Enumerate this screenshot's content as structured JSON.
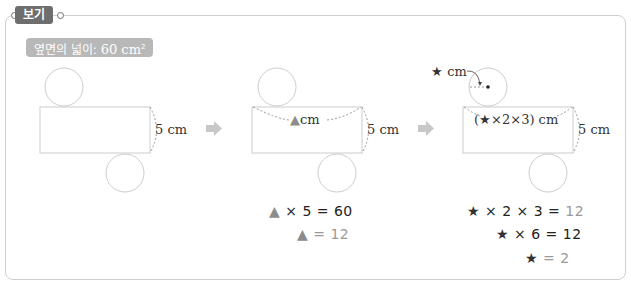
{
  "header": {
    "badge_label": "보기"
  },
  "given": {
    "label_prefix": "옆면의 넓이: ",
    "value": "60 cm",
    "superscript": "2"
  },
  "colors": {
    "badge_bg": "#6e6e6e",
    "label_bg": "#b8b8b8",
    "outline": "#cccccc",
    "arrow": "#c8c8c8",
    "triangle": "#8c8c8c"
  },
  "step1": {
    "height_label": "5 cm"
  },
  "step2": {
    "width_label_symbol": "▲",
    "width_label_unit": "cm",
    "height_label": "5 cm",
    "equations": [
      {
        "symbol": "▲",
        "expr": " × 5 = ",
        "result": "60"
      },
      {
        "symbol": "▲",
        "expr": " = ",
        "result": "12"
      }
    ]
  },
  "step3": {
    "radius_label_symbol": "★",
    "radius_label_unit": "cm",
    "width_label": "(★×2×3) cm",
    "height_label": "5 cm",
    "equations": [
      {
        "symbol": "★",
        "expr": " × 2 × 3 = ",
        "result": "12"
      },
      {
        "symbol": "★",
        "expr": " × 6 = ",
        "result": "12"
      },
      {
        "symbol": "★",
        "expr": " = ",
        "result": "2"
      }
    ]
  },
  "arrows": [
    "arrow-1",
    "arrow-2"
  ]
}
